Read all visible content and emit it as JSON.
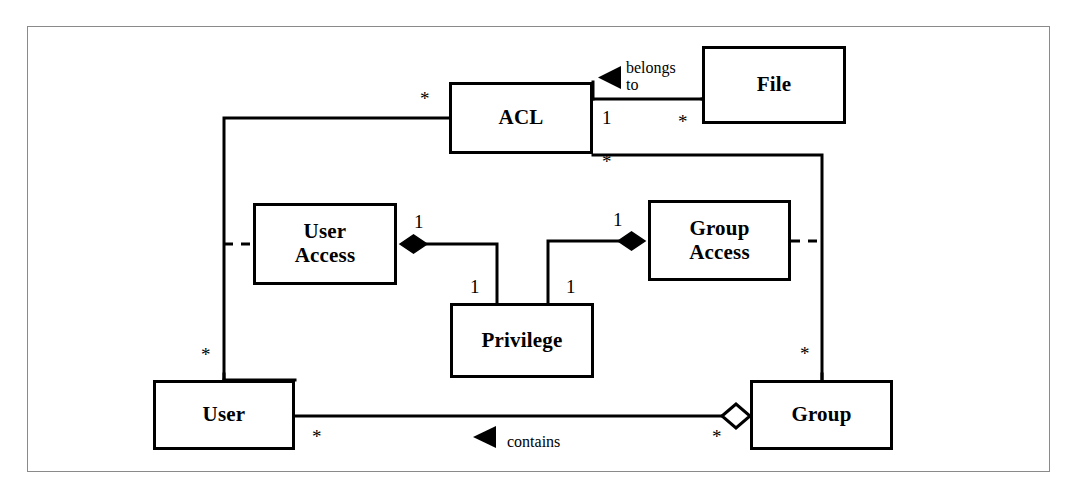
{
  "diagram": {
    "frame": {
      "border_color": "#8a8a8a"
    },
    "line_color": "#000000",
    "background": "#ffffff",
    "classes": [
      {
        "id": "acl",
        "name": "ACL",
        "x": 449,
        "y": 82,
        "w": 144,
        "h": 72
      },
      {
        "id": "file",
        "name": "File",
        "x": 702,
        "y": 46,
        "w": 144,
        "h": 78
      },
      {
        "id": "user-access",
        "name": "User\nAccess",
        "x": 253,
        "y": 203,
        "w": 144,
        "h": 82
      },
      {
        "id": "group-access",
        "name": "Group\nAccess",
        "x": 648,
        "y": 200,
        "w": 143,
        "h": 81
      },
      {
        "id": "privilege",
        "name": "Privilege",
        "x": 450,
        "y": 303,
        "w": 144,
        "h": 75
      },
      {
        "id": "user",
        "name": "User",
        "x": 153,
        "y": 380,
        "w": 142,
        "h": 70
      },
      {
        "id": "group",
        "name": "Group",
        "x": 750,
        "y": 380,
        "w": 143,
        "h": 70
      }
    ],
    "multiplicities": [
      {
        "id": "acl-user-star",
        "text": "*",
        "x": 420,
        "y": 89
      },
      {
        "id": "acl-file-one",
        "text": "1",
        "x": 602,
        "y": 108
      },
      {
        "id": "file-acl-star",
        "text": "*",
        "x": 678,
        "y": 112
      },
      {
        "id": "acl-group-star",
        "text": "*",
        "x": 602,
        "y": 152
      },
      {
        "id": "user-access-one",
        "text": "1",
        "x": 414,
        "y": 212
      },
      {
        "id": "group-access-one",
        "text": "1",
        "x": 613,
        "y": 210
      },
      {
        "id": "privilege-left-one",
        "text": "1",
        "x": 470,
        "y": 277
      },
      {
        "id": "privilege-right-one",
        "text": "1",
        "x": 566,
        "y": 277
      },
      {
        "id": "user-acl-star",
        "text": "*",
        "x": 201,
        "y": 345
      },
      {
        "id": "group-acl-star",
        "text": "*",
        "x": 800,
        "y": 344
      },
      {
        "id": "user-contains-star",
        "text": "*",
        "x": 312,
        "y": 427
      },
      {
        "id": "group-contains-star",
        "text": "*",
        "x": 712,
        "y": 427
      }
    ],
    "association_labels": [
      {
        "id": "belongs-to",
        "text": "belongs\nto",
        "x": 626,
        "y": 59
      },
      {
        "id": "contains",
        "text": "contains",
        "x": 507,
        "y": 433
      }
    ],
    "arrow_heads": [
      {
        "id": "belongs-to-arrow",
        "type": "filled-triangle",
        "direction": "left",
        "x": 598,
        "y": 70
      },
      {
        "id": "contains-arrow",
        "type": "filled-triangle",
        "direction": "left",
        "x": 473,
        "y": 437
      }
    ],
    "diamonds": [
      {
        "id": "user-access-composition",
        "type": "filled",
        "x": 413,
        "y": 244
      },
      {
        "id": "group-access-composition",
        "type": "filled",
        "x": 632,
        "y": 241
      },
      {
        "id": "group-aggregation",
        "type": "hollow",
        "x": 735,
        "y": 416
      }
    ]
  }
}
